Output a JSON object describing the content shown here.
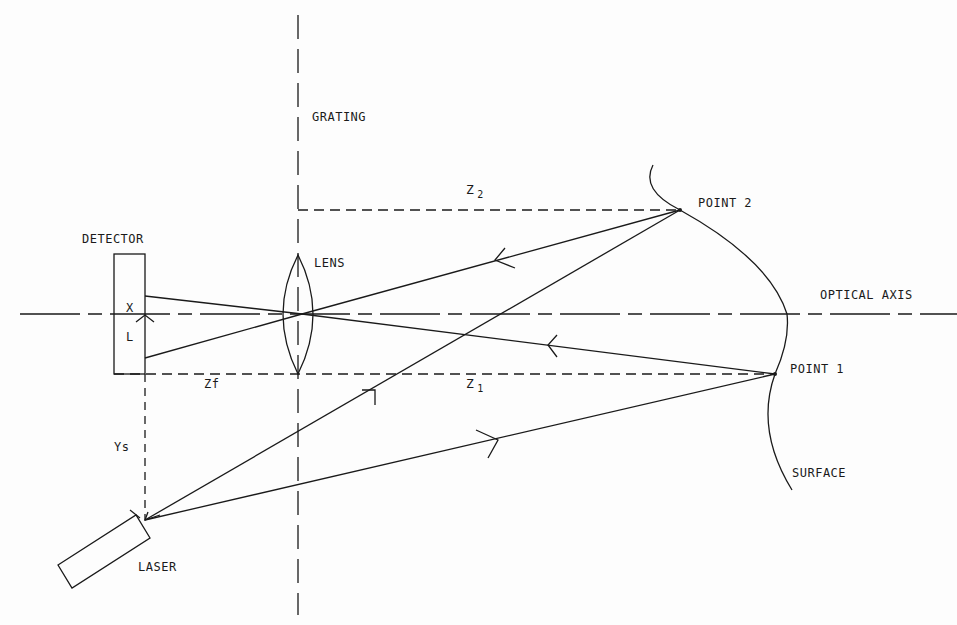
{
  "diagram": {
    "type": "optical triangulation schematic",
    "labels": {
      "grating": "GRATING",
      "detector": "DETECTOR",
      "lens": "LENS",
      "optical_axis": "OPTICAL AXIS",
      "point2": "POINT 2",
      "point1": "POINT 1",
      "surface": "SURFACE",
      "laser": "LASER",
      "z2": "Z",
      "z2_sub": "2",
      "z1": "Z",
      "z1_sub": "1",
      "zf": "Zf",
      "ys": "Ys",
      "x": "X",
      "l": "L"
    },
    "colors": {
      "line": "#1a1a1a",
      "background": "#fdfdfd"
    }
  }
}
